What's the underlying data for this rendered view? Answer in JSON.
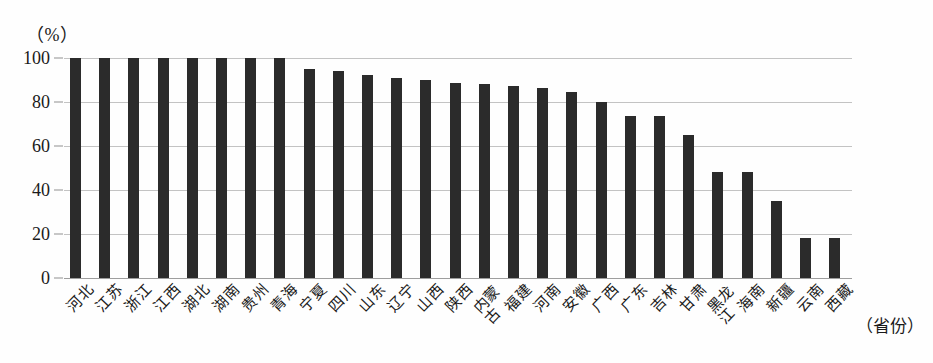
{
  "chart_data": {
    "type": "bar",
    "title": "",
    "subtitle": "",
    "xlabel": "（省份）",
    "ylabel": "（%）",
    "ylim": [
      0,
      100
    ],
    "yticks": [
      0,
      20,
      40,
      60,
      80,
      100
    ],
    "ytick_labels": [
      "0",
      "20",
      "40",
      "60",
      "80",
      "100"
    ],
    "grid": true,
    "legend": false,
    "legend_position": "none",
    "bar_color": "#2b2b2b",
    "categories": [
      "河北",
      "江苏",
      "浙江",
      "江西",
      "湖北",
      "湖南",
      "贵州",
      "青海",
      "宁夏",
      "四川",
      "山东",
      "辽宁",
      "山西",
      "陕西",
      "内蒙古",
      "福建",
      "河南",
      "安徽",
      "广西",
      "广东",
      "吉林",
      "甘肃",
      "黑龙江",
      "海南",
      "新疆",
      "云南",
      "西藏"
    ],
    "values": [
      100,
      100,
      100,
      100,
      100,
      100,
      100,
      100,
      95,
      94,
      92.5,
      91,
      90,
      88.5,
      88,
      87.5,
      86.5,
      84.5,
      80,
      73.5,
      73.5,
      65,
      48,
      48,
      35,
      18,
      18
    ],
    "annotations": []
  },
  "axis": {
    "unit_label": "（%）",
    "x_title": "（省份）"
  }
}
